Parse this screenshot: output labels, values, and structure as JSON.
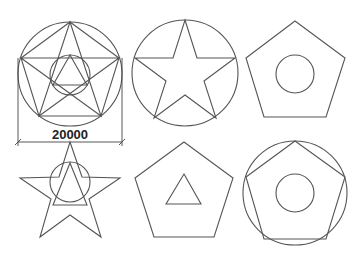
{
  "diagram": {
    "stroke_color": "#555555",
    "background": "#ffffff",
    "figures": [
      {
        "id": "fig1",
        "label": "Star inscribed in pentagon within circle, inner circle with triangle, with dimension",
        "dimension_label": "20000"
      },
      {
        "id": "fig2",
        "label": "Five-pointed star inscribed in circle"
      },
      {
        "id": "fig3",
        "label": "Pentagon with inner circle"
      },
      {
        "id": "fig4",
        "label": "Five-pointed star with inner circle and triangle"
      },
      {
        "id": "fig5",
        "label": "Pentagon with inner triangle"
      },
      {
        "id": "fig6",
        "label": "Pentagon inscribed in circle with inner circle"
      }
    ]
  }
}
